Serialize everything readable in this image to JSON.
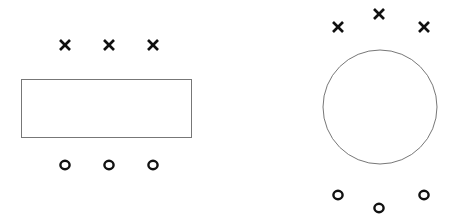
{
  "colors": {
    "background": "#ffffff",
    "shape_stroke": "#777777",
    "mark_fill": "#111111"
  },
  "diagram": {
    "left_figure": {
      "shape": "rectangle",
      "rect": {
        "x": 21,
        "y": 79,
        "width": 170,
        "height": 58
      },
      "top_marks": [
        {
          "label": "x",
          "x": 65,
          "y": 45
        },
        {
          "label": "x",
          "x": 109,
          "y": 45
        },
        {
          "label": "x",
          "x": 153,
          "y": 45
        }
      ],
      "bottom_marks": [
        {
          "label": "o",
          "x": 65,
          "y": 165
        },
        {
          "label": "o",
          "x": 109,
          "y": 165
        },
        {
          "label": "o",
          "x": 153,
          "y": 165
        }
      ]
    },
    "right_figure": {
      "shape": "circle",
      "circle": {
        "cx": 380,
        "cy": 107,
        "r": 57
      },
      "top_marks": [
        {
          "label": "x",
          "x": 338,
          "y": 27
        },
        {
          "label": "x",
          "x": 379,
          "y": 14
        },
        {
          "label": "x",
          "x": 424,
          "y": 27
        }
      ],
      "bottom_marks": [
        {
          "label": "o",
          "x": 338,
          "y": 195
        },
        {
          "label": "o",
          "x": 379,
          "y": 208
        },
        {
          "label": "o",
          "x": 424,
          "y": 195
        }
      ]
    }
  }
}
